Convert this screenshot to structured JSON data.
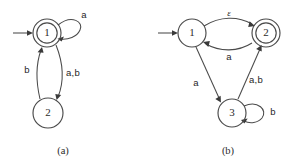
{
  "figure": {
    "background_color": "#ffffff",
    "ink_color": "#4a4a4a",
    "panels": [
      {
        "id": "panel-a",
        "caption": "(a)",
        "states": [
          {
            "id": "a1",
            "label": "1",
            "accepting": true,
            "start": true,
            "cx": 47,
            "cy": 33,
            "r": 14
          },
          {
            "id": "a2",
            "label": "2",
            "accepting": false,
            "start": false,
            "cx": 48,
            "cy": 113,
            "r": 15
          }
        ],
        "transitions": [
          {
            "from": "a1",
            "to": "a1",
            "label": "a",
            "kind": "self-loop-right"
          },
          {
            "from": "a1",
            "to": "a2",
            "label": "a,b",
            "kind": "curve-down"
          },
          {
            "from": "a2",
            "to": "a1",
            "label": "b",
            "kind": "curve-up"
          }
        ],
        "labels": {
          "self_loop": "a",
          "down_edge": "a,b",
          "up_edge": "b"
        }
      },
      {
        "id": "panel-b",
        "caption": "(b)",
        "states": [
          {
            "id": "b1",
            "label": "1",
            "accepting": false,
            "start": true,
            "cx": 192,
            "cy": 33,
            "r": 14
          },
          {
            "id": "b2",
            "label": "2",
            "accepting": true,
            "start": false,
            "cx": 266,
            "cy": 33,
            "r": 14
          },
          {
            "id": "b3",
            "label": "3",
            "accepting": false,
            "start": false,
            "cx": 232,
            "cy": 113,
            "r": 14
          }
        ],
        "transitions": [
          {
            "from": "b1",
            "to": "b2",
            "label": "ε",
            "kind": "curve-top"
          },
          {
            "from": "b2",
            "to": "b1",
            "label": "a",
            "kind": "curve-bottom"
          },
          {
            "from": "b1",
            "to": "b3",
            "label": "a",
            "kind": "diagonal-left"
          },
          {
            "from": "b3",
            "to": "b2",
            "label": "a,b",
            "kind": "diagonal-right"
          },
          {
            "from": "b3",
            "to": "b3",
            "label": "b",
            "kind": "self-loop-right"
          }
        ],
        "labels": {
          "top_edge": "ε",
          "bottom_edge": "a",
          "left_diagonal": "a",
          "right_diagonal": "a,b",
          "self_loop": "b"
        }
      }
    ]
  }
}
